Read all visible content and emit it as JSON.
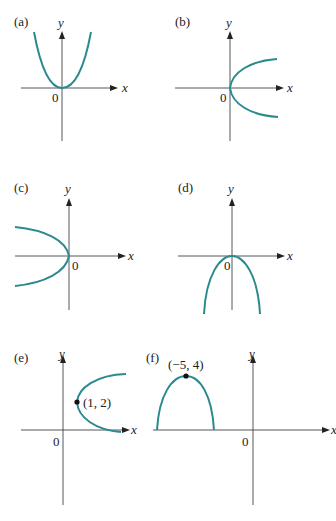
{
  "figure": {
    "panels": [
      {
        "label": "(a)",
        "origin_label": "0",
        "x_axis_label": "x",
        "y_axis_label": "y",
        "shape": "parabola opening up, vertex at origin"
      },
      {
        "label": "(b)",
        "origin_label": "0",
        "x_axis_label": "x",
        "y_axis_label": "y",
        "shape": "parabola opening right, vertex at origin"
      },
      {
        "label": "(c)",
        "origin_label": "0",
        "x_axis_label": "x",
        "y_axis_label": "y",
        "shape": "parabola opening left, vertex at origin"
      },
      {
        "label": "(d)",
        "origin_label": "0",
        "x_axis_label": "x",
        "y_axis_label": "y",
        "shape": "parabola opening down, vertex at origin"
      },
      {
        "label": "(e)",
        "origin_label": "0",
        "x_axis_label": "x",
        "y_axis_label": "y",
        "shape": "parabola opening right, vertex at (1, 2)",
        "point_label": "(1, 2)"
      },
      {
        "label": "(f)",
        "origin_label": "0",
        "x_axis_label": "x",
        "y_axis_label": "y",
        "shape": "parabola opening down, vertex at (-5, 4)",
        "point_label": "(−5, 4)"
      }
    ],
    "colors": {
      "curve": "#2a8a8e",
      "axis": "#444444",
      "text": "#222222"
    }
  }
}
